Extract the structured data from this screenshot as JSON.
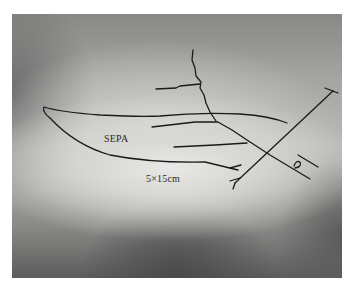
{
  "image": {
    "description": "Grayscale clinical photograph with hand-drawn flap outline markings",
    "labels": {
      "flap_name": "SEPA",
      "flap_size": "5×15cm"
    },
    "colors": {
      "ink": "#1a1a1a",
      "background_light": "#e8e8e6",
      "background_dark": "#4a4a4a"
    }
  }
}
